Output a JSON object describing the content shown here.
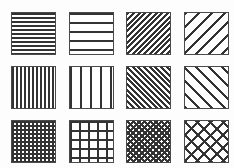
{
  "sheet": {
    "title": "Hatch Pattern Swatch Sheet",
    "background_color": "#fdfdfd",
    "swatch_fill_color": "#ffffff",
    "line_color": "#333333",
    "border_color": "#4a4a4a",
    "columns": 4,
    "rows": 3,
    "total_swatches": 12,
    "swatch_width": 45,
    "swatch_height": 43,
    "column_x": [
      11,
      69,
      126,
      184
    ],
    "row_y": [
      12,
      66,
      120
    ]
  },
  "swatches": [
    {
      "index": 1,
      "name": "horizontal-lines-dense",
      "label": "Horizontal lines — dense",
      "orientation": "horizontal",
      "density": "dense",
      "line_count": 11,
      "spacing_px": 4,
      "line_width_px": 2,
      "angle_deg": 0,
      "col": 0,
      "row": 0
    },
    {
      "index": 2,
      "name": "horizontal-lines-sparse",
      "label": "Horizontal lines — sparse",
      "orientation": "horizontal",
      "density": "sparse",
      "line_count": 5,
      "spacing_px": 9,
      "line_width_px": 2,
      "angle_deg": 0,
      "col": 1,
      "row": 0
    },
    {
      "index": 3,
      "name": "diagonal-forward-dense",
      "label": "Diagonal lines forward — dense",
      "orientation": "diagonal-forward",
      "density": "dense",
      "line_count": 22,
      "spacing_px": 4,
      "line_width_px": 2,
      "angle_deg": 45,
      "col": 2,
      "row": 0
    },
    {
      "index": 4,
      "name": "diagonal-forward-sparse",
      "label": "Diagonal lines forward — sparse",
      "orientation": "diagonal-forward",
      "density": "sparse",
      "line_count": 9,
      "spacing_px": 9,
      "line_width_px": 2,
      "angle_deg": 45,
      "col": 3,
      "row": 0
    },
    {
      "index": 5,
      "name": "vertical-lines-dense",
      "label": "Vertical lines — dense",
      "orientation": "vertical",
      "density": "dense",
      "line_count": 11,
      "spacing_px": 4,
      "line_width_px": 2,
      "angle_deg": 90,
      "col": 0,
      "row": 1
    },
    {
      "index": 6,
      "name": "vertical-lines-sparse",
      "label": "Vertical lines — sparse",
      "orientation": "vertical",
      "density": "sparse",
      "line_count": 4,
      "spacing_px": 10,
      "line_width_px": 2,
      "angle_deg": 90,
      "col": 1,
      "row": 1
    },
    {
      "index": 7,
      "name": "diagonal-backward-dense",
      "label": "Diagonal lines backward — dense",
      "orientation": "diagonal-backward",
      "density": "dense",
      "line_count": 22,
      "spacing_px": 4,
      "line_width_px": 2,
      "angle_deg": -45,
      "col": 2,
      "row": 1
    },
    {
      "index": 8,
      "name": "diagonal-backward-sparse",
      "label": "Diagonal lines backward — sparse",
      "orientation": "diagonal-backward",
      "density": "sparse",
      "line_count": 9,
      "spacing_px": 9,
      "line_width_px": 2,
      "angle_deg": -45,
      "col": 3,
      "row": 1
    },
    {
      "index": 9,
      "name": "grid-crosshatch-dense",
      "label": "Square grid crosshatch — dense",
      "orientation": "grid",
      "density": "dense",
      "line_count": 22,
      "spacing_px": 4,
      "line_width_px": 2,
      "angle_deg": 0,
      "col": 0,
      "row": 2
    },
    {
      "index": 10,
      "name": "grid-crosshatch-sparse",
      "label": "Square grid crosshatch — sparse",
      "orientation": "grid",
      "density": "sparse",
      "line_count": 10,
      "spacing_px": 9,
      "line_width_px": 2,
      "angle_deg": 0,
      "col": 1,
      "row": 2
    },
    {
      "index": 11,
      "name": "diagonal-crosshatch-dense",
      "label": "Diagonal crosshatch — dense",
      "orientation": "diagonal-crosshatch",
      "density": "dense",
      "line_count": 44,
      "spacing_px": 4,
      "line_width_px": 2,
      "angle_deg": 45,
      "col": 2,
      "row": 2
    },
    {
      "index": 12,
      "name": "diagonal-crosshatch-sparse",
      "label": "Diagonal crosshatch — sparse",
      "orientation": "diagonal-crosshatch",
      "density": "sparse",
      "line_count": 18,
      "spacing_px": 9,
      "line_width_px": 2,
      "angle_deg": 45,
      "col": 3,
      "row": 2
    }
  ]
}
